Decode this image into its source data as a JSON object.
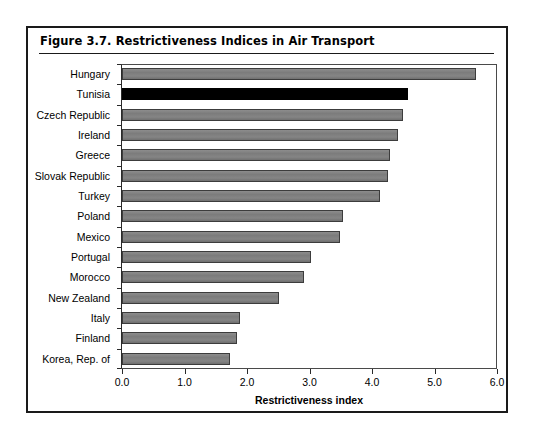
{
  "figure": {
    "title": "Figure 3.7.  Restrictiveness Indices in Air Transport"
  },
  "chart_data": {
    "type": "bar",
    "orientation": "horizontal",
    "title": "Figure 3.7.  Restrictiveness Indices in Air Transport",
    "subtitle": "",
    "xlabel": "Restrictiveness index",
    "ylabel": "",
    "xlim": [
      0.0,
      6.0
    ],
    "xticks": [
      "0.0",
      "1.0",
      "2.0",
      "3.0",
      "4.0",
      "5.0",
      "6.0"
    ],
    "xtick_values": [
      0.0,
      1.0,
      2.0,
      3.0,
      4.0,
      5.0,
      6.0
    ],
    "grid": false,
    "legend": null,
    "highlight_category": "Tunisia",
    "colors": {
      "bar": "#808080",
      "bar_border": "#3c3c3c",
      "highlight_bar": "#000000",
      "frame": "#1a1a1a",
      "text": "#000000"
    },
    "categories": [
      "Hungary",
      "Tunisia",
      "Czech Republic",
      "Ireland",
      "Greece",
      "Slovak Republic",
      "Turkey",
      "Poland",
      "Mexico",
      "Portugal",
      "Morocco",
      "New Zealand",
      "Italy",
      "Finland",
      "Korea, Rep. of"
    ],
    "values": [
      5.66,
      4.58,
      4.49,
      4.42,
      4.28,
      4.25,
      4.12,
      3.54,
      3.49,
      3.02,
      2.91,
      2.51,
      1.88,
      1.84,
      1.73
    ],
    "bars": [
      {
        "label": "Hungary",
        "value": 5.66,
        "highlight": false
      },
      {
        "label": "Tunisia",
        "value": 4.58,
        "highlight": true
      },
      {
        "label": "Czech Republic",
        "value": 4.49,
        "highlight": false
      },
      {
        "label": "Ireland",
        "value": 4.42,
        "highlight": false
      },
      {
        "label": "Greece",
        "value": 4.28,
        "highlight": false
      },
      {
        "label": "Slovak Republic",
        "value": 4.25,
        "highlight": false
      },
      {
        "label": "Turkey",
        "value": 4.12,
        "highlight": false
      },
      {
        "label": "Poland",
        "value": 3.54,
        "highlight": false
      },
      {
        "label": "Mexico",
        "value": 3.49,
        "highlight": false
      },
      {
        "label": "Portugal",
        "value": 3.02,
        "highlight": false
      },
      {
        "label": "Morocco",
        "value": 2.91,
        "highlight": false
      },
      {
        "label": "New Zealand",
        "value": 2.51,
        "highlight": false
      },
      {
        "label": "Italy",
        "value": 1.88,
        "highlight": false
      },
      {
        "label": "Finland",
        "value": 1.84,
        "highlight": false
      },
      {
        "label": "Korea, Rep. of",
        "value": 1.73,
        "highlight": false
      }
    ]
  }
}
